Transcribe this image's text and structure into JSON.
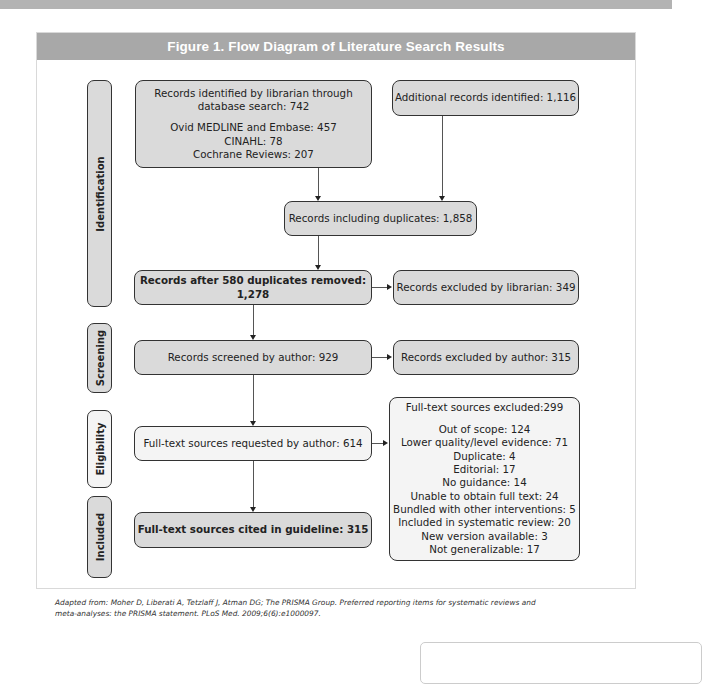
{
  "figure": {
    "title": "Figure 1.  Flow Diagram of Literature Search Results",
    "caption_line1": "Adapted from: Moher D, Liberati A, Tetzlaff J, Atman DG; The PRISMA Group. Preferred reporting items for systematic reviews and",
    "caption_line2": "meta-analyses: the PRISMA statement. PLoS Med. 2009;6(6):e1000097."
  },
  "phases": {
    "identification": "Identification",
    "screening": "Screening",
    "eligibility": "Eligibility",
    "included": "Included"
  },
  "boxes": {
    "librarian_search": {
      "line1": "Records identified by librarian through",
      "line2": "database search: 742",
      "sub1": "Ovid MEDLINE and Embase: 457",
      "sub2": "CINAHL: 78",
      "sub3": "Cochrane Reviews: 207"
    },
    "additional_records": "Additional records identified: 1,116",
    "including_duplicates": "Records including duplicates: 1,858",
    "after_duplicates": "Records after 580 duplicates removed: 1,278",
    "excluded_librarian": "Records excluded by librarian: 349",
    "screened_author": "Records screened by author: 929",
    "excluded_author": "Records excluded by author: 315",
    "fulltext_requested": "Full-text sources requested by author: 614",
    "fulltext_cited": "Full-text sources cited in guideline: 315",
    "fulltext_excluded": {
      "title": "Full-text sources excluded:299",
      "reasons": [
        "Out of scope: 124",
        "Lower quality/level evidence: 71",
        "Duplicate: 4",
        "Editorial: 17",
        "No guidance: 14",
        "Unable to obtain full text: 24",
        "Bundled with other interventions: 5",
        "Included in systematic review: 20",
        "New version available: 3",
        "Not generalizable: 17"
      ]
    }
  }
}
